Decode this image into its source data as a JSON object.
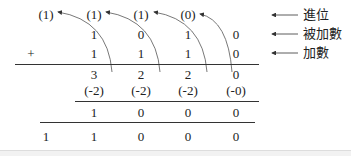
{
  "carries": [
    "(1)",
    "(1)",
    "(1)",
    "(0)"
  ],
  "augend": [
    "1",
    "0",
    "1",
    "0"
  ],
  "plus_sign": "+",
  "addend": [
    "1",
    "1",
    "1",
    "0"
  ],
  "column_sums": [
    "3",
    "2",
    "2",
    "0"
  ],
  "subtractions": [
    "(-2)",
    "(-2)",
    "(-2)",
    "(-0)"
  ],
  "partial_result": [
    "1",
    "0",
    "0",
    "0"
  ],
  "final_result": [
    "1",
    "1",
    "0",
    "0",
    "0"
  ],
  "labels": {
    "carry": "進位",
    "augend": "被加數",
    "addend": "加數"
  }
}
